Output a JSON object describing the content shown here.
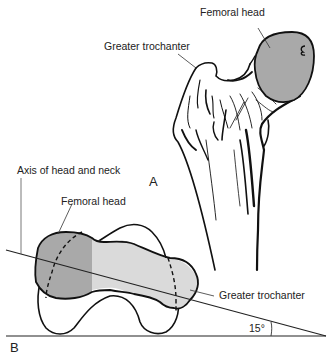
{
  "figure": {
    "panel_a": {
      "letter": "A",
      "labels": {
        "femoral_head": "Femoral head",
        "greater_trochanter": "Greater trochanter"
      }
    },
    "panel_b": {
      "letter": "B",
      "labels": {
        "axis": "Axis of head and neck",
        "femoral_head": "Femoral head",
        "greater_trochanter": "Greater trochanter",
        "angle": "15°"
      }
    },
    "colors": {
      "head_fill": "#a9a9a9",
      "neck_fill": "#d9d9d9",
      "line": "#111111",
      "text": "#222222"
    }
  }
}
